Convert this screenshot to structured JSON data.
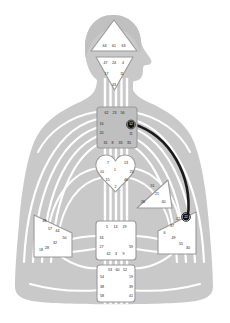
{
  "figure": {
    "subtitle": "Body silhouette with nine energy centers and numbered gates"
  },
  "palette": {
    "body_fill": "#c9c9c9",
    "channel_white": "#ffffff",
    "center_fill": "#ffffff",
    "center_stroke": "#8c8c8c",
    "throat_fill": "#bfbfbf",
    "active_channel": "#1a1a1a",
    "active_gate_fill": "#111111",
    "gate_text": "#1a1a1a",
    "page_bg": "#ffffff"
  },
  "chart_data": {
    "type": "diagram",
    "centers": [
      {
        "id": "head",
        "name": "Head",
        "shape": "triangle-up",
        "defined": false,
        "gates": [
          {
            "number": "64",
            "active": false
          },
          {
            "number": "61",
            "active": false
          },
          {
            "number": "63",
            "active": false
          }
        ]
      },
      {
        "id": "ajna",
        "name": "Ajna",
        "shape": "triangle-down",
        "defined": false,
        "gates": [
          {
            "number": "47",
            "active": false
          },
          {
            "number": "24",
            "active": false
          },
          {
            "number": "4",
            "active": false
          },
          {
            "number": "17",
            "active": false
          },
          {
            "number": "11",
            "active": false
          },
          {
            "number": "43",
            "active": false
          }
        ]
      },
      {
        "id": "throat",
        "name": "Throat",
        "shape": "square",
        "defined": false,
        "gates": [
          {
            "number": "62",
            "active": false
          },
          {
            "number": "23",
            "active": false
          },
          {
            "number": "56",
            "active": false
          },
          {
            "number": "16",
            "active": false
          },
          {
            "number": "20",
            "active": false
          },
          {
            "number": "31",
            "active": false
          },
          {
            "number": "8",
            "active": false
          },
          {
            "number": "33",
            "active": false
          },
          {
            "number": "35",
            "active": false
          },
          {
            "number": "45",
            "active": false
          },
          {
            "number": "12",
            "active": true
          }
        ]
      },
      {
        "id": "g",
        "name": "G Center",
        "shape": "heart",
        "defined": false,
        "gates": [
          {
            "number": "7",
            "active": false
          },
          {
            "number": "1",
            "active": false
          },
          {
            "number": "13",
            "active": false
          },
          {
            "number": "10",
            "active": false
          },
          {
            "number": "25",
            "active": false
          },
          {
            "number": "15",
            "active": false
          },
          {
            "number": "46",
            "active": false
          },
          {
            "number": "2",
            "active": false
          }
        ]
      },
      {
        "id": "ego",
        "name": "Ego / Heart",
        "shape": "triangle-right",
        "defined": false,
        "gates": [
          {
            "number": "51",
            "active": false
          },
          {
            "number": "21",
            "active": false
          },
          {
            "number": "26",
            "active": false
          },
          {
            "number": "40",
            "active": false
          }
        ]
      },
      {
        "id": "spleen",
        "name": "Spleen",
        "shape": "triangle-left",
        "defined": false,
        "gates": [
          {
            "number": "48",
            "active": false
          },
          {
            "number": "57",
            "active": false
          },
          {
            "number": "44",
            "active": false
          },
          {
            "number": "50",
            "active": false
          },
          {
            "number": "32",
            "active": false
          },
          {
            "number": "28",
            "active": false
          },
          {
            "number": "18",
            "active": false
          }
        ]
      },
      {
        "id": "solar_plexus",
        "name": "Solar Plexus",
        "shape": "triangle-right",
        "defined": false,
        "gates": [
          {
            "number": "22",
            "active": true
          },
          {
            "number": "12",
            "active": false
          },
          {
            "number": "37",
            "active": false
          },
          {
            "number": "6",
            "active": false
          },
          {
            "number": "49",
            "active": false
          },
          {
            "number": "55",
            "active": false
          },
          {
            "number": "30",
            "active": false
          },
          {
            "number": "36",
            "active": false
          }
        ]
      },
      {
        "id": "sacral",
        "name": "Sacral",
        "shape": "square",
        "defined": false,
        "gates": [
          {
            "number": "5",
            "active": false
          },
          {
            "number": "14",
            "active": false
          },
          {
            "number": "29",
            "active": false
          },
          {
            "number": "34",
            "active": false
          },
          {
            "number": "59",
            "active": false
          },
          {
            "number": "27",
            "active": false
          },
          {
            "number": "42",
            "active": false
          },
          {
            "number": "3",
            "active": false
          },
          {
            "number": "9",
            "active": false
          }
        ]
      },
      {
        "id": "root",
        "name": "Root",
        "shape": "square",
        "defined": false,
        "gates": [
          {
            "number": "53",
            "active": false
          },
          {
            "number": "60",
            "active": false
          },
          {
            "number": "52",
            "active": false
          },
          {
            "number": "54",
            "active": false
          },
          {
            "number": "19",
            "active": false
          },
          {
            "number": "38",
            "active": false
          },
          {
            "number": "39",
            "active": false
          },
          {
            "number": "58",
            "active": false
          },
          {
            "number": "41",
            "active": false
          }
        ]
      }
    ],
    "active_channels": [
      {
        "id": "12-22",
        "from_gate": "12",
        "from_center": "throat",
        "to_gate": "22",
        "to_center": "solar_plexus",
        "name": "Channel of Openness",
        "style": "solid-dark-curve"
      }
    ],
    "gate_positions": {
      "head": [
        {
          "n": "64",
          "x": 104.5,
          "y": 46.5
        },
        {
          "n": "61",
          "x": 114.0,
          "y": 46.5
        },
        {
          "n": "63",
          "x": 123.5,
          "y": 46.5
        }
      ],
      "ajna": [
        {
          "n": "47",
          "x": 105.5,
          "y": 63.5
        },
        {
          "n": "24",
          "x": 114.0,
          "y": 63.5
        },
        {
          "n": "4",
          "x": 123.0,
          "y": 63.5
        },
        {
          "n": "17",
          "x": 106.5,
          "y": 74.0
        },
        {
          "n": "11",
          "x": 122.0,
          "y": 74.0
        },
        {
          "n": "43",
          "x": 114.0,
          "y": 85.5
        }
      ],
      "throat": [
        {
          "n": "62",
          "x": 106.5,
          "y": 113.0
        },
        {
          "n": "23",
          "x": 114.5,
          "y": 113.0
        },
        {
          "n": "56",
          "x": 122.5,
          "y": 113.0
        },
        {
          "n": "16",
          "x": 101.5,
          "y": 124.5
        },
        {
          "n": "20",
          "x": 101.5,
          "y": 133.5
        },
        {
          "n": "12",
          "x": 131.0,
          "y": 124.5,
          "active": true
        },
        {
          "n": "11",
          "x": 131.0,
          "y": 134.5
        },
        {
          "n": "31",
          "x": 105.5,
          "y": 143.5
        },
        {
          "n": "8",
          "x": 112.5,
          "y": 143.5
        },
        {
          "n": "33",
          "x": 120.5,
          "y": 143.5
        },
        {
          "n": "35",
          "x": 129.0,
          "y": 143.5
        }
      ],
      "g": [
        {
          "n": "7",
          "x": 108.0,
          "y": 163.0
        },
        {
          "n": "1",
          "x": 115.0,
          "y": 170.5
        },
        {
          "n": "13",
          "x": 126.0,
          "y": 163.0
        },
        {
          "n": "10",
          "x": 102.0,
          "y": 172.5
        },
        {
          "n": "25",
          "x": 131.5,
          "y": 172.5
        },
        {
          "n": "15",
          "x": 107.5,
          "y": 180.0
        },
        {
          "n": "46",
          "x": 126.0,
          "y": 180.0
        },
        {
          "n": "2",
          "x": 115.5,
          "y": 187.5
        }
      ],
      "ego": [
        {
          "n": "51",
          "x": 152.5,
          "y": 186.0
        },
        {
          "n": "21",
          "x": 157.0,
          "y": 194.5
        },
        {
          "n": "26",
          "x": 143.0,
          "y": 202.5
        },
        {
          "n": "40",
          "x": 163.5,
          "y": 202.5
        }
      ],
      "spleen": [
        {
          "n": "48",
          "x": 44.5,
          "y": 221.0
        },
        {
          "n": "57",
          "x": 50.0,
          "y": 229.5
        },
        {
          "n": "44",
          "x": 57.5,
          "y": 231.5
        },
        {
          "n": "50",
          "x": 64.5,
          "y": 238.0
        },
        {
          "n": "32",
          "x": 55.0,
          "y": 243.0
        },
        {
          "n": "28",
          "x": 47.0,
          "y": 248.5
        },
        {
          "n": "18",
          "x": 41.0,
          "y": 250.5
        }
      ],
      "solar_plexus": [
        {
          "n": "22",
          "x": 186.0,
          "y": 217.0,
          "active": true
        },
        {
          "n": "12",
          "x": 178.0,
          "y": 219.0
        },
        {
          "n": "37",
          "x": 172.0,
          "y": 226.0
        },
        {
          "n": "6",
          "x": 164.5,
          "y": 233.0
        },
        {
          "n": "49",
          "x": 173.5,
          "y": 238.5
        },
        {
          "n": "55",
          "x": 181.0,
          "y": 244.5
        },
        {
          "n": "30",
          "x": 188.0,
          "y": 248.5
        }
      ],
      "sacral": [
        {
          "n": "5",
          "x": 107.0,
          "y": 227.5
        },
        {
          "n": "14",
          "x": 115.5,
          "y": 227.5
        },
        {
          "n": "29",
          "x": 124.5,
          "y": 227.5
        },
        {
          "n": "34",
          "x": 101.5,
          "y": 238.5
        },
        {
          "n": "59",
          "x": 131.0,
          "y": 247.0
        },
        {
          "n": "27",
          "x": 101.5,
          "y": 247.5
        },
        {
          "n": "42",
          "x": 108.5,
          "y": 254.5
        },
        {
          "n": "3",
          "x": 116.0,
          "y": 254.5
        },
        {
          "n": "9",
          "x": 123.5,
          "y": 254.5
        }
      ],
      "root": [
        {
          "n": "53",
          "x": 110.0,
          "y": 270.5
        },
        {
          "n": "60",
          "x": 117.5,
          "y": 270.5
        },
        {
          "n": "52",
          "x": 125.0,
          "y": 270.5
        },
        {
          "n": "54",
          "x": 102.0,
          "y": 277.5
        },
        {
          "n": "19",
          "x": 131.0,
          "y": 277.5
        },
        {
          "n": "38",
          "x": 102.0,
          "y": 287.0
        },
        {
          "n": "39",
          "x": 131.0,
          "y": 287.0
        },
        {
          "n": "58",
          "x": 102.0,
          "y": 296.0
        },
        {
          "n": "41",
          "x": 131.0,
          "y": 296.0
        }
      ]
    }
  }
}
